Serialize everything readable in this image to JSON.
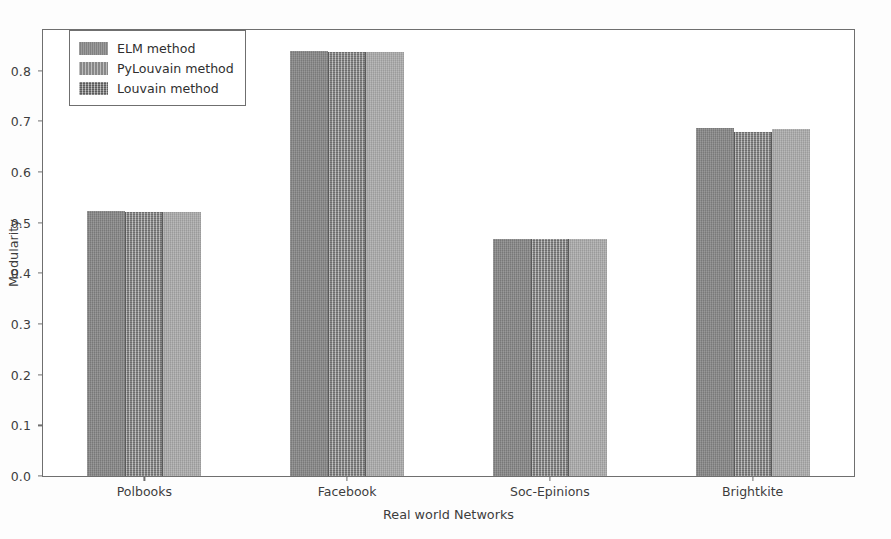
{
  "chart_data": {
    "type": "bar",
    "title": "",
    "xlabel": "Real world Networks",
    "ylabel": "Modularity",
    "categories": [
      "Polbooks",
      "Facebook",
      "Soc-Epinions",
      "Brightkite"
    ],
    "series": [
      {
        "name": "ELM method",
        "values": [
          0.523,
          0.838,
          0.468,
          0.686
        ]
      },
      {
        "name": "PyLouvain method",
        "values": [
          0.521,
          0.837,
          0.468,
          0.679
        ]
      },
      {
        "name": "Louvain method",
        "values": [
          0.52,
          0.836,
          0.467,
          0.684
        ]
      }
    ],
    "ylim": [
      0.0,
      0.88
    ],
    "yticks": [
      "0.0",
      "0.1",
      "0.2",
      "0.3",
      "0.4",
      "0.5",
      "0.6",
      "0.7",
      "0.8"
    ],
    "ytick_values": [
      0.0,
      0.1,
      0.2,
      0.3,
      0.4,
      0.5,
      0.6,
      0.7,
      0.8
    ],
    "grid": false,
    "legend_position": "upper left",
    "series_colors": [
      "#878787",
      "#9a9a9a",
      "#a9a9a9"
    ]
  },
  "legend": {
    "items": [
      {
        "label": "ELM method"
      },
      {
        "label": "PyLouvain method"
      },
      {
        "label": "Louvain method"
      }
    ]
  }
}
